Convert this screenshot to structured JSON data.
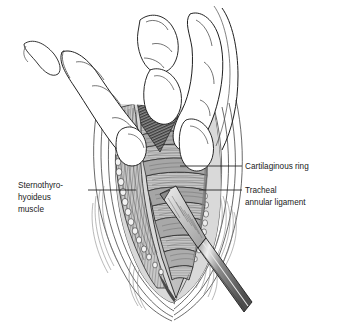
{
  "figure": {
    "style": "black-and-white medical line art with gray wash",
    "background_color": "#ffffff",
    "line_color": "#1a1a1a"
  },
  "labels": [
    {
      "id": "cartilaginous-ring",
      "text": "Cartilaginous ring",
      "side": "right",
      "lines": [
        "Cartilaginous ring"
      ],
      "text_x": 245,
      "text_y": 169,
      "leader": {
        "x1": 180,
        "y1": 166,
        "x2": 242,
        "y2": 166
      }
    },
    {
      "id": "tracheal-annular-ligament",
      "text": "Tracheal annular ligament",
      "side": "right",
      "lines": [
        "Tracheal",
        "annular ligament"
      ],
      "text_x": 245,
      "text_y": 193,
      "leader": {
        "x1": 199,
        "y1": 190,
        "x2": 242,
        "y2": 190
      }
    },
    {
      "id": "sternothyrohyoideus-muscle",
      "text": "Sternothyro-hyoideus muscle",
      "side": "left",
      "lines": [
        "Sternothyro-",
        "hyoideus",
        "muscle"
      ],
      "text_x": 18,
      "text_y": 188,
      "leader": {
        "x1": 88,
        "y1": 190,
        "x2": 136,
        "y2": 190
      }
    }
  ],
  "anatomy": {
    "structures": [
      {
        "name": "trachea",
        "fill": "#b9b9b9"
      },
      {
        "name": "cartilaginous-rings",
        "fill": "#c6c6c6"
      },
      {
        "name": "annular-ligaments",
        "fill": "#a8a8a8"
      },
      {
        "name": "sternothyrohyoideus-muscle",
        "fill": "#c8c8c8"
      },
      {
        "name": "subcutaneous-tissue",
        "fill": "#d6d6d6"
      },
      {
        "name": "skin-edge",
        "fill": "#ffffff"
      },
      {
        "name": "deep-tissue-shadow",
        "fill": "#6f6f6f"
      }
    ]
  },
  "instrument": {
    "name": "scalpel",
    "blade_fill": "#cfcfcf",
    "handle_fill": "#6b6b6b",
    "handle_highlight": "#e8e8e8"
  },
  "hand": {
    "name": "surgeon-hand",
    "digits": [
      "thumb",
      "index-finger"
    ],
    "fill": "#ffffff",
    "outline": "#1a1a1a"
  }
}
